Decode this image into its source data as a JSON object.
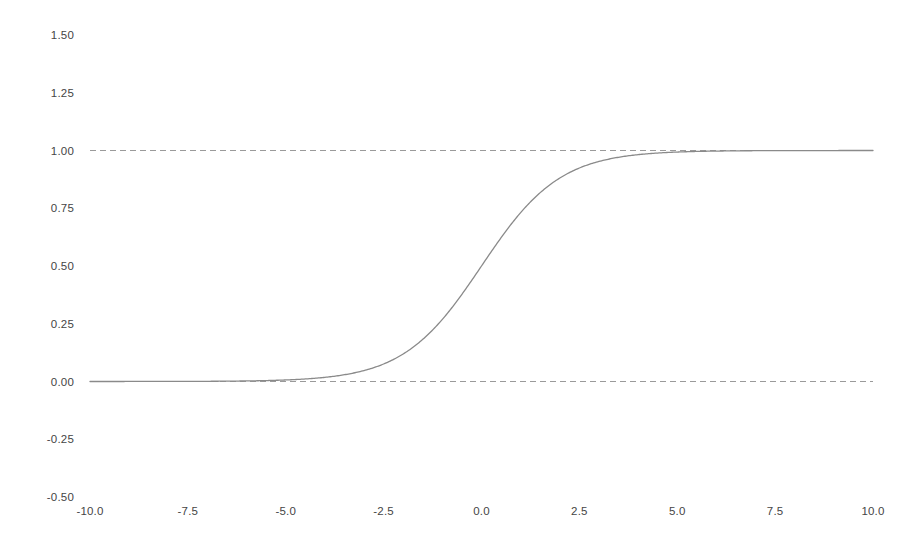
{
  "figure": {
    "background_color": "#ffffff",
    "width": 924,
    "height": 549
  },
  "chart_data": {
    "type": "line",
    "title": "",
    "subtitle": "",
    "xlabel": "",
    "ylabel": "",
    "grid": false,
    "legend": null,
    "legend_position": "none",
    "xlim": [
      -10.0,
      10.0
    ],
    "ylim": [
      -0.5,
      1.5
    ],
    "xticks": [
      -10.0,
      -7.5,
      -5.0,
      -2.5,
      0.0,
      2.5,
      5.0,
      7.5,
      10.0
    ],
    "xtick_labels": [
      "-10.0",
      "-7.5",
      "-5.0",
      "-2.5",
      "0.0",
      "2.5",
      "5.0",
      "7.5",
      "10.0"
    ],
    "yticks": [
      1.5,
      1.25,
      1.0,
      0.75,
      0.5,
      0.25,
      0.0,
      -0.25,
      -0.5
    ],
    "ytick_labels": [
      "1.50",
      "1.25",
      "1.00",
      "0.75",
      "0.50",
      "0.25",
      "0.00",
      "-0.25",
      "-0.50"
    ],
    "series": [
      {
        "name": "sigmoid",
        "function": "1/(1+exp(-x))",
        "style": "solid",
        "color": "#8a8a8a",
        "linewidth": 1.3,
        "x": [
          -10.0,
          -9.5,
          -9.0,
          -8.5,
          -8.0,
          -7.5,
          -7.0,
          -6.5,
          -6.0,
          -5.5,
          -5.0,
          -4.5,
          -4.0,
          -3.5,
          -3.0,
          -2.5,
          -2.0,
          -1.5,
          -1.0,
          -0.5,
          0.0,
          0.5,
          1.0,
          1.5,
          2.0,
          2.5,
          3.0,
          3.5,
          4.0,
          4.5,
          5.0,
          5.5,
          6.0,
          6.5,
          7.0,
          7.5,
          8.0,
          8.5,
          9.0,
          9.5,
          10.0
        ],
        "values": [
          4.54e-05,
          7.49e-05,
          0.0001234,
          0.0002035,
          0.0003354,
          0.0005527,
          0.000911,
          0.0015012,
          0.0024726,
          0.0040701,
          0.0066929,
          0.0109869,
          0.0179862,
          0.0293122,
          0.0474259,
          0.0758582,
          0.1192029,
          0.1824255,
          0.2689414,
          0.3775407,
          0.5,
          0.6224593,
          0.7310586,
          0.8175745,
          0.8807971,
          0.9241418,
          0.9525741,
          0.9706878,
          0.9820138,
          0.9890131,
          0.9933071,
          0.9959299,
          0.9975274,
          0.9984988,
          0.9990889,
          0.9994473,
          0.9996646,
          0.9997965,
          0.9998766,
          0.9999251,
          0.9999546
        ]
      }
    ],
    "reference_lines": [
      {
        "name": "upper-asymptote",
        "orientation": "horizontal",
        "value": 1.0,
        "style": "dashed",
        "color": "#9a9a9a",
        "linewidth": 1.0
      },
      {
        "name": "lower-asymptote",
        "orientation": "horizontal",
        "value": 0.0,
        "style": "dashed",
        "color": "#9a9a9a",
        "linewidth": 1.0
      }
    ],
    "annotations": [],
    "colors": {
      "curve": "#8a8a8a",
      "reference_line": "#9a9a9a",
      "tick_label": "#454545",
      "background": "#ffffff"
    }
  }
}
